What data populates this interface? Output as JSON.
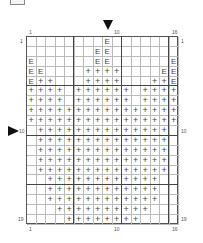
{
  "chart": {
    "columns": 16,
    "rows": 19,
    "symbols": {
      "E": "E",
      "+": "+"
    },
    "grid": [
      "........E.......",
      ".......EE.......",
      "E......EE......E",
      "EE....++++....EE",
      "E++...++++...++E",
      "++++.++++++.++++",
      "++++.++++++.++++",
      "++++++++++++++++",
      "++++++++++++++++",
      ".++++++++++++++.",
      ".++++++++++++++.",
      ".++++++++++++++.",
      ".++++++++++++++.",
      ".++++++++++++++.",
      "..++++++++++++..",
      "..++++++++++++..",
      "..++++++++++++..",
      "...++++++++++...",
      "....++++++++...."
    ],
    "thick_col_lines_after": [
      5,
      10,
      15
    ],
    "thick_row_lines_after": [
      5,
      10,
      15
    ],
    "marker_column": 9,
    "marker_row": 10
  },
  "labels": {
    "top_col_1": "1",
    "top_col_10": "10",
    "top_col_16": "16",
    "bottom_col_1": "1",
    "bottom_col_10": "10",
    "bottom_col_16": "16",
    "left_row_1": "1",
    "left_row_10": "10",
    "left_row_19": "19",
    "right_row_1": "1",
    "right_row_10": "10",
    "right_row_19": "19"
  }
}
